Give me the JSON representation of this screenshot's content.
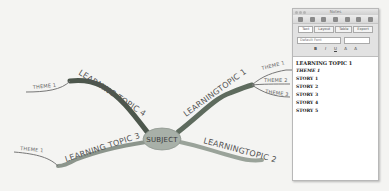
{
  "mindmap": {
    "subject": "SUBJECT",
    "topics": [
      {
        "label": "LEARNINGTOPIC 1",
        "themes": [
          "THEME 1",
          "THEME 2",
          "THEME 3"
        ]
      },
      {
        "label": "LEARNINGTOPIC 2",
        "themes": []
      },
      {
        "label": "LEARNING TOPIC 3",
        "themes": [
          "THEME 1"
        ]
      },
      {
        "label": "LEARNING TOPIC 4",
        "themes": [
          "THEME 1"
        ]
      }
    ],
    "colors": {
      "background": "#f4f4f2",
      "topic1": "#5e6b5e",
      "topic2": "#9aa39a",
      "topic3": "#8c958c",
      "topic4": "#4d574d",
      "subject_fill": "#a8b0a8"
    }
  },
  "panel": {
    "title": "Notes",
    "tabs": [
      "Text",
      "Layout",
      "Table",
      "Export"
    ],
    "font_select": "Default Font",
    "size_select": "",
    "format_buttons": [
      "B",
      "I",
      "U",
      "A",
      "A"
    ],
    "outline": [
      {
        "text": "LEARNING TOPIC 1",
        "style": "h1"
      },
      {
        "text": "THEME 1",
        "style": "italic"
      },
      {
        "text": "STORY 1",
        "style": "normal"
      },
      {
        "text": "STORY 2",
        "style": "normal"
      },
      {
        "text": "STORY 3",
        "style": "normal"
      },
      {
        "text": "STORY 4",
        "style": "normal"
      },
      {
        "text": "STORY 5",
        "style": "normal"
      }
    ]
  }
}
